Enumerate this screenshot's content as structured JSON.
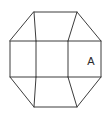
{
  "figure": {
    "background_color": "#ffffff",
    "line_color": "#3c3c3c",
    "line_width": 1,
    "label_color": "#2b2b2b",
    "canvas": {
      "width": 111,
      "height": 117
    },
    "labels": [
      {
        "name": "face-label-a",
        "text": "A",
        "x": 91,
        "y": 62,
        "font_size": 11
      }
    ],
    "outline": {
      "name": "octagon-outline",
      "points": "34,12 77,12 101,41 101,77 77,107 34,107 10,77 10,41"
    },
    "segments": [
      {
        "name": "band-top-edge",
        "x1": 10,
        "y1": 41,
        "x2": 101,
        "y2": 41
      },
      {
        "name": "band-bottom-edge",
        "x1": 10,
        "y1": 77,
        "x2": 101,
        "y2": 77
      },
      {
        "name": "band-divider-left",
        "x1": 36,
        "y1": 41,
        "x2": 36,
        "y2": 77
      },
      {
        "name": "band-divider-right",
        "x1": 68,
        "y1": 41,
        "x2": 68,
        "y2": 77
      },
      {
        "name": "top-fold-left",
        "x1": 34,
        "y1": 12,
        "x2": 36,
        "y2": 41
      },
      {
        "name": "top-fold-right",
        "x1": 77,
        "y1": 12,
        "x2": 68,
        "y2": 41
      },
      {
        "name": "bottom-fold-left",
        "x1": 34,
        "y1": 107,
        "x2": 36,
        "y2": 77
      },
      {
        "name": "bottom-fold-right",
        "x1": 77,
        "y1": 107,
        "x2": 68,
        "y2": 77
      }
    ]
  }
}
